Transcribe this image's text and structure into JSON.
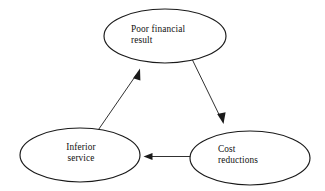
{
  "diagram": {
    "background_color": "#ffffff",
    "stroke_color": "#1a1a1a",
    "nodes": [
      {
        "id": "poor-financial-result",
        "label": "Poor financial\nresult",
        "shape": "ellipse",
        "cx": 165,
        "cy": 36,
        "rx": 61,
        "ry": 27
      },
      {
        "id": "cost-reductions",
        "label": "Cost\nreductions",
        "shape": "ellipse",
        "cx": 250,
        "cy": 158,
        "rx": 60,
        "ry": 27
      },
      {
        "id": "inferior-service",
        "label": "Inferior\nservice",
        "shape": "ellipse",
        "cx": 80,
        "cy": 155,
        "rx": 60,
        "ry": 27
      }
    ],
    "edges": [
      {
        "id": "edge-poor-financial-result-to-cost-reductions",
        "from": "poor-financial-result",
        "to": "cost-reductions",
        "arrow": "single",
        "direction": "down-right"
      },
      {
        "id": "edge-cost-reductions-to-inferior-service",
        "from": "cost-reductions",
        "to": "inferior-service",
        "arrow": "single",
        "direction": "left"
      },
      {
        "id": "edge-inferior-service-to-poor-financial-result",
        "from": "inferior-service",
        "to": "poor-financial-result",
        "arrow": "single",
        "direction": "up-right"
      }
    ]
  }
}
